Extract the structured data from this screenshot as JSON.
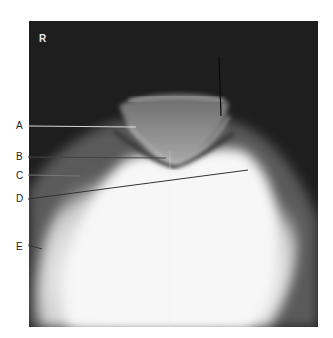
{
  "figure": {
    "type": "radiograph",
    "view": "knee skyline (sunrise) view",
    "side_marker": "R",
    "labels": [
      {
        "letter": "A"
      },
      {
        "letter": "B"
      },
      {
        "letter": "C"
      },
      {
        "letter": "D"
      },
      {
        "letter": "E"
      }
    ]
  }
}
